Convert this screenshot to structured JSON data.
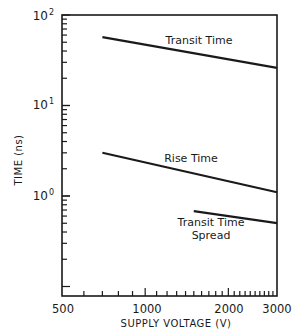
{
  "chart_data": {
    "type": "line",
    "title": "",
    "xlabel": "SUPPLY VOLTAGE (V)",
    "ylabel": "TIME (ns)",
    "xscale": "log",
    "yscale": "log",
    "xlim": [
      500,
      3000
    ],
    "ylim": [
      0.076,
      100
    ],
    "x_tick_labels": [
      "500",
      "1000",
      "2000",
      "3000"
    ],
    "y_tick_labels": [
      {
        "base": "10",
        "exp": "2",
        "value": 100
      },
      {
        "base": "10",
        "exp": "1",
        "value": 10
      },
      {
        "base": "10",
        "exp": "0",
        "value": 1
      }
    ],
    "grid": false,
    "legend": "none (inline labels)",
    "series": [
      {
        "name": "Transit Time",
        "x": [
          700,
          3000
        ],
        "y": [
          57,
          26
        ]
      },
      {
        "name": "Rise Time",
        "x": [
          700,
          3000
        ],
        "y": [
          3.0,
          1.1
        ]
      },
      {
        "name": "Transit Time Spread",
        "x": [
          1500,
          3000
        ],
        "y": [
          0.68,
          0.5
        ]
      }
    ],
    "annotations": [
      {
        "text": "Transit Time",
        "series": "Transit Time"
      },
      {
        "text": "Rise Time",
        "series": "Rise Time"
      },
      {
        "text": [
          "Transit Time",
          "Spread"
        ],
        "series": "Transit Time Spread"
      }
    ]
  }
}
